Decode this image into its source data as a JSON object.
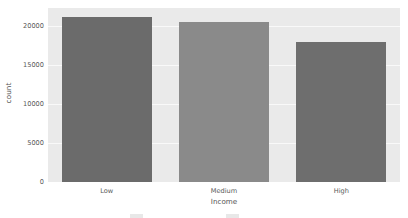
{
  "chart_data": {
    "type": "bar",
    "title": "",
    "xlabel": "Income",
    "ylabel": "count",
    "categories": [
      "Low",
      "Medium",
      "High"
    ],
    "values": [
      21150,
      20500,
      17950
    ],
    "ylim": [
      0,
      22300
    ],
    "yticks": [
      0,
      5000,
      10000,
      15000,
      20000
    ],
    "ytick_labels": [
      "0",
      "5000",
      "10000",
      "15000",
      "20000"
    ],
    "grid": true,
    "legend": "none",
    "bar_colors": [
      "#6b6b6b",
      "#8a8a8a",
      "#6e6e6e"
    ],
    "plot_background": "#eaeaea",
    "figure_background": "#ffffff",
    "gridline_color": "#fafafa",
    "tick_label_color": "#585858",
    "axis_label_color": "#555555"
  },
  "artifact": {
    "swatch_label": "",
    "text_label": ""
  }
}
